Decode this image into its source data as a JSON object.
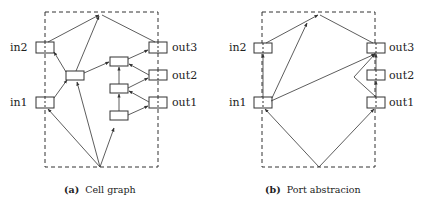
{
  "figures": [
    {
      "id": "a",
      "caption_tag": "(a)",
      "caption_text": "Cell graph",
      "ports": {
        "in2": "in2",
        "in1": "in1",
        "out3": "out3",
        "out2": "out2",
        "out1": "out1"
      }
    },
    {
      "id": "b",
      "caption_tag": "(b)",
      "caption_text": "Port abstracion",
      "ports": {
        "in2": "in2",
        "in1": "in1",
        "out3": "out3",
        "out2": "out2",
        "out1": "out1"
      }
    }
  ],
  "colors": {
    "stroke": "#333333",
    "background": "#ffffff"
  }
}
